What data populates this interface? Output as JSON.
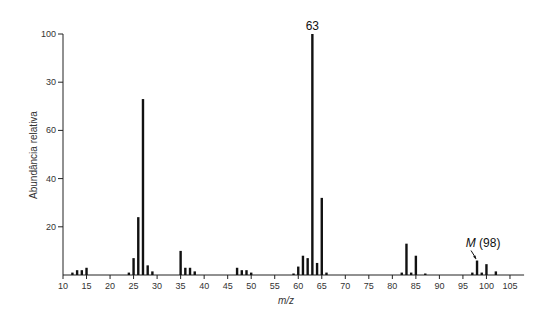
{
  "chart_data": {
    "type": "bar",
    "title": "",
    "xlabel": "m/z",
    "ylabel": "Abundância relativa",
    "xlim": [
      10,
      108
    ],
    "ylim": [
      0,
      100
    ],
    "grid": false,
    "x_ticks": [
      10,
      15,
      20,
      25,
      30,
      35,
      40,
      45,
      50,
      55,
      60,
      65,
      70,
      75,
      80,
      85,
      90,
      95,
      100,
      105
    ],
    "y_ticks": [
      {
        "value": 20,
        "label": "20"
      },
      {
        "value": 40,
        "label": "40"
      },
      {
        "value": 60,
        "label": "60"
      },
      {
        "value": 80,
        "label": "30"
      },
      {
        "value": 100,
        "label": "100"
      }
    ],
    "x": [
      12,
      13,
      14,
      15,
      24,
      25,
      26,
      27,
      28,
      29,
      35,
      36,
      37,
      38,
      47,
      48,
      49,
      50,
      59,
      60,
      61,
      62,
      63,
      64,
      65,
      66,
      82,
      83,
      84,
      85,
      87,
      97,
      98,
      99,
      100,
      102
    ],
    "values": [
      1,
      2,
      2,
      3,
      1,
      7,
      24,
      73,
      4,
      1.5,
      10,
      3,
      3,
      1.5,
      3,
      2,
      2,
      1,
      0.5,
      3.5,
      8,
      7,
      100,
      5,
      32,
      1,
      1,
      13,
      1,
      8,
      0.5,
      1,
      6,
      1,
      4.5,
      1.5
    ],
    "annotations": [
      {
        "x": 63,
        "text": "63",
        "italic_part": ""
      },
      {
        "x": 98,
        "text": "(98)",
        "italic_part": "M",
        "arrow": true
      }
    ]
  }
}
